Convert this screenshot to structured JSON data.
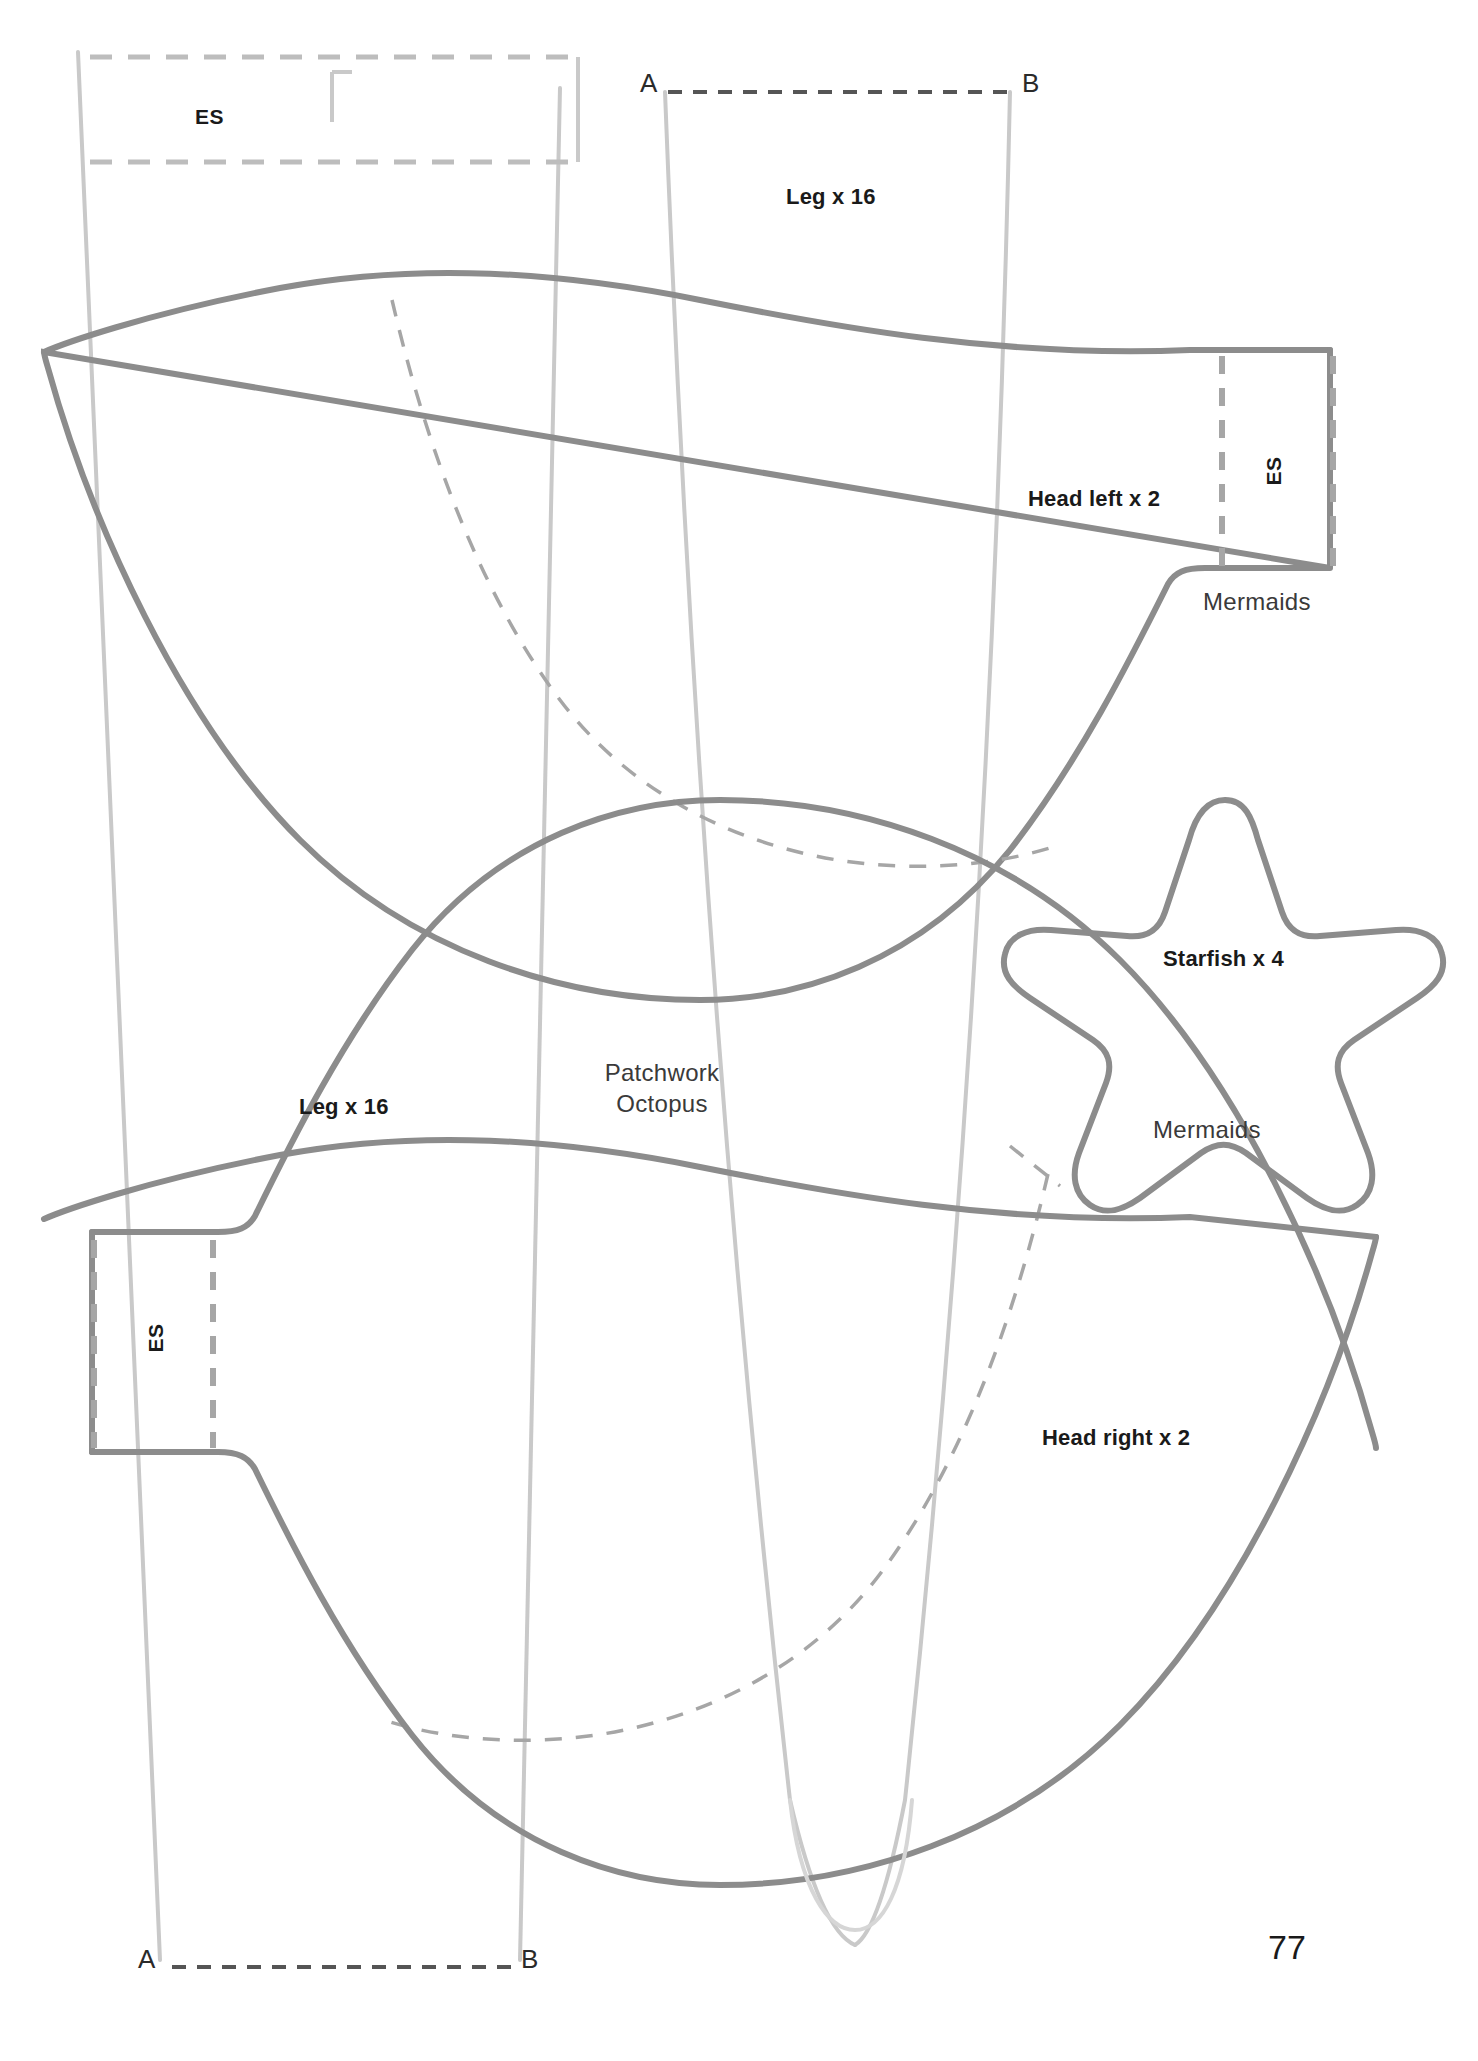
{
  "page": {
    "number": "77",
    "background_color": "#ffffff",
    "width": 1478,
    "height": 2061
  },
  "colors": {
    "solid_dark": "#8c8c8c",
    "solid_light": "#c9c9c9",
    "dashed_mid": "#a6a6a6",
    "dashed_light": "#bdbdbd",
    "text_dark": "#1a1a1a",
    "text_mid": "#3a3a3a"
  },
  "pattern": {
    "title": "Patchwork Octopus",
    "brand": "Mermaids",
    "pieces": [
      {
        "id": "leg-top",
        "label": "Leg x 16",
        "weight": "bold"
      },
      {
        "id": "leg-bottom",
        "label": "Leg x 16",
        "weight": "bold"
      },
      {
        "id": "head-left",
        "label": "Head left x 2",
        "weight": "bold"
      },
      {
        "id": "head-right",
        "label": "Head right x 2",
        "weight": "bold"
      },
      {
        "id": "starfish",
        "label": "Starfish x 4",
        "weight": "bold"
      }
    ]
  },
  "labels": {
    "title_line1": "Patchwork",
    "title_line2": "Octopus",
    "leg_top": "Leg x 16",
    "leg_bottom": "Leg x 16",
    "head_left": "Head left x 2",
    "head_right": "Head right x 2",
    "starfish": "Starfish x 4",
    "mermaids_top": "Mermaids",
    "mermaids_starfish": "Mermaids",
    "es_top_left": "ES",
    "es_right": "ES",
    "es_bottom_left": "ES",
    "a_top": "A",
    "b_top": "B",
    "a_bottom": "A",
    "b_bottom": "B",
    "page_number": "77"
  }
}
